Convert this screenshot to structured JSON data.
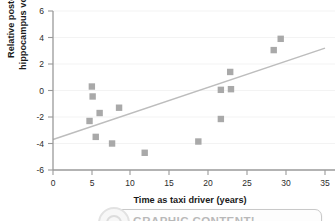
{
  "chart_data": {
    "type": "scatter",
    "title": "",
    "xlabel": "Time as taxi driver (years)",
    "ylabel": "Relative posterior hippocampus volume",
    "xlim": [
      0,
      35
    ],
    "ylim": [
      -6,
      6
    ],
    "xticks": [
      0,
      5,
      10,
      15,
      20,
      25,
      30,
      35
    ],
    "yticks": [
      -6,
      -4,
      -2,
      0,
      2,
      4,
      6
    ],
    "xtick_labels": [
      "0",
      "5",
      "10",
      "15",
      "20",
      "25",
      "30",
      "35"
    ],
    "ytick_labels": [
      "-6",
      "-4",
      "-2",
      "0",
      "2",
      "4",
      "6"
    ],
    "grid": false,
    "legend": null,
    "marker_shape": "square",
    "marker_color": "#a9a9a9",
    "series": [
      {
        "name": "Taxi drivers",
        "points": [
          {
            "x": 4.7,
            "y": -2.3
          },
          {
            "x": 5.0,
            "y": 0.3
          },
          {
            "x": 5.1,
            "y": -0.45
          },
          {
            "x": 5.5,
            "y": -3.5
          },
          {
            "x": 6.0,
            "y": -1.7
          },
          {
            "x": 7.6,
            "y": -4.0
          },
          {
            "x": 8.5,
            "y": -1.3
          },
          {
            "x": 11.8,
            "y": -4.7
          },
          {
            "x": 18.7,
            "y": -3.85
          },
          {
            "x": 21.6,
            "y": -2.15
          },
          {
            "x": 21.6,
            "y": 0.05
          },
          {
            "x": 22.8,
            "y": 1.4
          },
          {
            "x": 22.9,
            "y": 0.1
          },
          {
            "x": 28.4,
            "y": 3.05
          },
          {
            "x": 29.3,
            "y": 3.9
          }
        ]
      }
    ],
    "trendline": {
      "name": "regression-line",
      "color": "#bdbdbd",
      "x_start": 0,
      "y_start": -3.7,
      "x_end": 35,
      "y_end": 3.2
    }
  },
  "banner": {
    "text": "GRAPHIC CONTENT!",
    "logo_name": "circular-logo"
  }
}
